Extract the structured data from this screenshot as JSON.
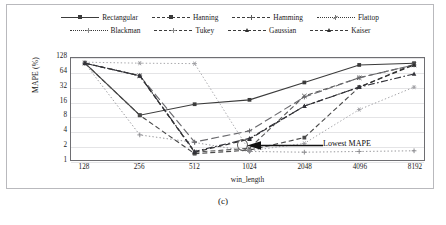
{
  "figure": {
    "caption": "(c)",
    "annotation": {
      "label": "Lowest MAPE",
      "marker": "circle-highlight"
    }
  },
  "chart_data": {
    "type": "line",
    "title": "",
    "xlabel": "win_length",
    "ylabel": "MAPE (%)",
    "categories": [
      "128",
      "256",
      "512",
      "1024",
      "2048",
      "4096",
      "8192"
    ],
    "yscale": "log2",
    "yticks": [
      "128",
      "64",
      "32",
      "16",
      "8",
      "4",
      "2",
      "1"
    ],
    "ylim": [
      1,
      128
    ],
    "grid": true,
    "legend_position": "top",
    "legend_rows": 2,
    "legend_columns": 4,
    "series": [
      {
        "name": "Rectangular",
        "dash": "solid",
        "marker": "square",
        "color": "#3b3b3b",
        "values": [
          100,
          8.4,
          14.2,
          17.5,
          40,
          92,
          100
        ]
      },
      {
        "name": "Hanning",
        "dash": "dash",
        "marker": "square",
        "color": "#4a4a4a",
        "values": [
          100,
          8.4,
          1.35,
          1.6,
          2.9,
          32,
          96
        ]
      },
      {
        "name": "Hamming",
        "dash": "dash",
        "marker": "cross",
        "color": "#5a5a5a",
        "values": [
          100,
          55,
          1.45,
          1.75,
          21,
          50,
          92
        ]
      },
      {
        "name": "Flattop",
        "dash": "dot",
        "marker": "star",
        "color": "#9a9a9e",
        "values": [
          105,
          100,
          98,
          1.55,
          2.2,
          11,
          32
        ]
      },
      {
        "name": "Blackman",
        "dash": "dot",
        "marker": "plus",
        "color": "#8a8a8e",
        "values": [
          100,
          3.3,
          2.3,
          1.5,
          1.45,
          1.5,
          1.55
        ]
      },
      {
        "name": "Tukey",
        "dash": "longdash",
        "marker": "plus",
        "color": "#6a6a6e",
        "values": [
          100,
          55,
          2.35,
          4.0,
          20,
          50,
          92
        ]
      },
      {
        "name": "Gaussian",
        "dash": "dash",
        "marker": "tri",
        "color": "#2f2f2f",
        "values": [
          100,
          55,
          1.45,
          2.7,
          13,
          32,
          92
        ]
      },
      {
        "name": "Kaiser",
        "dash": "dashdot",
        "marker": "tri",
        "color": "#33333a",
        "values": [
          100,
          55,
          1.5,
          2.8,
          13,
          32,
          60
        ]
      }
    ]
  }
}
